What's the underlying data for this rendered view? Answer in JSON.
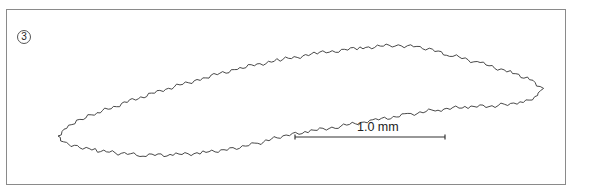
{
  "figure": {
    "panel_label": "3",
    "scale_bar": {
      "label": "1.0 mm",
      "x1": 295,
      "x2": 445,
      "y": 137
    },
    "outline_color": "#333333",
    "frame_color": "#8a8a8a"
  }
}
